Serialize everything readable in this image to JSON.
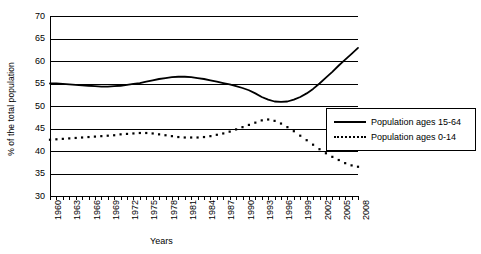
{
  "page": {
    "clipped_top_text": "",
    "background": "#ffffff",
    "ink_color": "#000000"
  },
  "legend": {
    "position": "right",
    "items": [
      {
        "label": "Population ages 15-64",
        "style": "solid"
      },
      {
        "label": "Population ages 0-14",
        "style": "dotted"
      }
    ]
  },
  "axes": {
    "y_title": "% of the total population",
    "x_title": "Years",
    "y_ticks": [
      "70",
      "65",
      "60",
      "55",
      "50",
      "45",
      "40",
      "35",
      "30"
    ],
    "x_ticks": [
      "1960",
      "1963",
      "1966",
      "1969",
      "1972",
      "1975",
      "1978",
      "1981",
      "1984",
      "1987",
      "1990",
      "1993",
      "1996",
      "1999",
      "2002",
      "2005",
      "2008"
    ]
  },
  "chart_data": {
    "type": "line",
    "title": "",
    "xlabel": "Years",
    "ylabel": "% of the total population",
    "ylim": [
      30,
      70
    ],
    "xlim": [
      1960,
      2008
    ],
    "grid": true,
    "legend_position": "right",
    "x": [
      1960,
      1961,
      1962,
      1963,
      1964,
      1965,
      1966,
      1967,
      1968,
      1969,
      1970,
      1971,
      1972,
      1973,
      1974,
      1975,
      1976,
      1977,
      1978,
      1979,
      1980,
      1981,
      1982,
      1983,
      1984,
      1985,
      1986,
      1987,
      1988,
      1989,
      1990,
      1991,
      1992,
      1993,
      1994,
      1995,
      1996,
      1997,
      1998,
      1999,
      2000,
      2001,
      2002,
      2003,
      2004,
      2005,
      2006,
      2007,
      2008
    ],
    "series": [
      {
        "name": "Population ages 15-64",
        "style": "solid",
        "values": [
          55.0,
          55.0,
          54.9,
          54.8,
          54.7,
          54.6,
          54.5,
          54.4,
          54.3,
          54.3,
          54.4,
          54.5,
          54.7,
          54.9,
          55.1,
          55.4,
          55.7,
          56.0,
          56.2,
          56.4,
          56.5,
          56.5,
          56.4,
          56.2,
          56.0,
          55.7,
          55.4,
          55.1,
          54.8,
          54.4,
          54.0,
          53.5,
          52.8,
          52.0,
          51.4,
          51.0,
          50.9,
          51.0,
          51.4,
          52.0,
          52.8,
          53.8,
          55.0,
          56.3,
          57.6,
          59.0,
          60.3,
          61.6,
          62.9
        ]
      },
      {
        "name": "Population ages 0-14",
        "style": "dotted",
        "values": [
          42.5,
          42.6,
          42.7,
          42.8,
          42.9,
          43.0,
          43.1,
          43.2,
          43.3,
          43.4,
          43.5,
          43.7,
          43.8,
          43.9,
          44.0,
          44.0,
          43.9,
          43.7,
          43.5,
          43.3,
          43.1,
          43.0,
          43.0,
          43.0,
          43.1,
          43.3,
          43.6,
          43.9,
          44.3,
          44.8,
          45.3,
          45.8,
          46.3,
          46.8,
          47.0,
          46.7,
          46.1,
          45.3,
          44.4,
          43.4,
          42.4,
          41.4,
          40.4,
          39.5,
          38.7,
          38.0,
          37.3,
          36.8,
          36.5
        ]
      }
    ]
  }
}
